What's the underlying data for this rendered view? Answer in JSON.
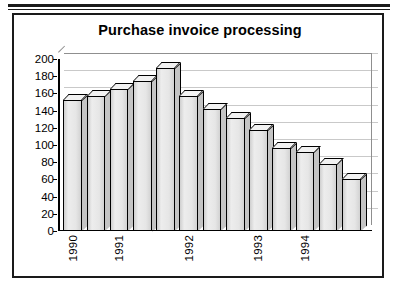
{
  "figure": {
    "title": "Purchase invoice processing"
  },
  "chart_data": {
    "type": "bar",
    "title": "Purchase invoice processing",
    "xlabel": "",
    "ylabel": "",
    "ylim": [
      0,
      200
    ],
    "ytick_step": 20,
    "grid": true,
    "legend": false,
    "style": "3d-column",
    "bar_count": 13,
    "yticks": [
      "0",
      "20",
      "40",
      "60",
      "80",
      "100",
      "120",
      "140",
      "160",
      "180",
      "200"
    ],
    "xtick_labels": [
      "1990",
      "1991",
      "1992",
      "1993",
      "1994"
    ],
    "xtick_bar_index": [
      0,
      2,
      5,
      8,
      10
    ],
    "categories": [
      "1",
      "2",
      "3",
      "4",
      "5",
      "6",
      "7",
      "8",
      "9",
      "10",
      "11",
      "12",
      "13"
    ],
    "values": [
      152,
      157,
      165,
      175,
      190,
      157,
      142,
      131,
      118,
      97,
      92,
      78,
      60
    ]
  }
}
